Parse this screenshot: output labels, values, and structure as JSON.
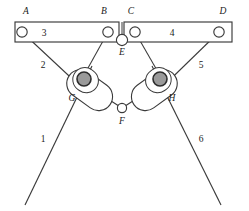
{
  "figure": {
    "type": "mechanism-kinematic-diagram",
    "background_color": "#ffffff",
    "stroke_color": "#3a3a3a",
    "pivot_fill_color": "#9a9a9a",
    "joint_fill_color": "#ffffff",
    "joints": [
      {
        "id": "A",
        "label": "A",
        "label_x": 26,
        "label_y": 14,
        "cx": 22,
        "cy": 32,
        "r": 5.2,
        "kind": "revolute-open"
      },
      {
        "id": "B",
        "label": "B",
        "label_x": 104,
        "label_y": 14,
        "cx": 108,
        "cy": 32,
        "r": 5.2,
        "kind": "revolute-open"
      },
      {
        "id": "C",
        "label": "C",
        "label_x": 131,
        "label_y": 14,
        "cx": 135,
        "cy": 32,
        "r": 5.2,
        "kind": "revolute-open"
      },
      {
        "id": "D",
        "label": "D",
        "label_x": 223,
        "label_y": 14,
        "cx": 219,
        "cy": 32,
        "r": 5.2,
        "kind": "revolute-open"
      },
      {
        "id": "E",
        "label": "E",
        "label_x": 118,
        "label_y": 55,
        "cx": 122,
        "cy": 40,
        "r": 5.6,
        "kind": "revolute-open"
      },
      {
        "id": "F",
        "label": "F",
        "label_x": 118,
        "label_y": 124,
        "cx": 122,
        "cy": 108,
        "r": 4.6,
        "kind": "revolute-open"
      },
      {
        "id": "G",
        "label": "G",
        "label_x": 70,
        "label_y": 100,
        "cx": 84,
        "cy": 79,
        "r": 7.0,
        "kind": "slider-pivot"
      },
      {
        "id": "H",
        "label": "H",
        "label_x": 163,
        "label_y": 100,
        "cx": 160,
        "cy": 79,
        "r": 7.0,
        "kind": "slider-pivot"
      }
    ],
    "links": [
      {
        "id": "1",
        "label": "1",
        "label_x": 43,
        "label_y": 142
      },
      {
        "id": "2",
        "label": "2",
        "label_x": 43,
        "label_y": 68
      },
      {
        "id": "3",
        "label": "3",
        "label_x": 44,
        "label_y": 36
      },
      {
        "id": "4",
        "label": "4",
        "label_x": 170,
        "label_y": 36
      },
      {
        "id": "5",
        "label": "5",
        "label_x": 201,
        "label_y": 68
      },
      {
        "id": "6",
        "label": "6",
        "label_x": 201,
        "label_y": 142
      }
    ],
    "frame_bar": {
      "x": 15,
      "y": 22,
      "width": 217,
      "height": 20,
      "gap_left": 119,
      "gap_right": 124
    }
  }
}
